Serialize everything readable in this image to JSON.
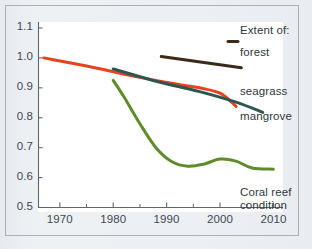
{
  "chart_data": {
    "type": "line",
    "title": "",
    "subtitle": "",
    "xlabel": "",
    "ylabel": "",
    "xlim": [
      1966,
      2012
    ],
    "ylim": [
      0.5,
      1.12
    ],
    "grid": false,
    "legend_position": "right",
    "x_ticks": [
      1970,
      1980,
      1990,
      2000,
      2010
    ],
    "x_tick_labels": [
      "1970",
      "1980",
      "1990",
      "2000",
      "2010"
    ],
    "x_minor_ticks": [
      1965,
      1975,
      1985,
      1995,
      2005
    ],
    "y_ticks": [
      0.5,
      0.6,
      0.7,
      0.8,
      0.9,
      1.0,
      1.1
    ],
    "y_tick_labels": [
      "0.5",
      "0.6",
      "0.7",
      "0.8",
      "0.9",
      "1.0",
      "1.1"
    ],
    "series": [
      {
        "name": "forest",
        "color": "#3b2a18",
        "label": "forest",
        "points": [
          [
            1989,
            1.005
          ],
          [
            1995,
            0.99
          ],
          [
            2004,
            0.967
          ]
        ]
      },
      {
        "name": "seagrass",
        "color": "#e8431f",
        "label": "seagrass",
        "points": [
          [
            1967,
            1.0
          ],
          [
            1975,
            0.973
          ],
          [
            1985,
            0.935
          ],
          [
            1992,
            0.912
          ],
          [
            1997,
            0.897
          ],
          [
            2000,
            0.882
          ],
          [
            2002,
            0.855
          ],
          [
            2003,
            0.838
          ]
        ]
      },
      {
        "name": "mangrove",
        "color": "#2d5650",
        "label": "mangrove",
        "points": [
          [
            1980,
            0.963
          ],
          [
            1988,
            0.922
          ],
          [
            1996,
            0.888
          ],
          [
            2003,
            0.852
          ],
          [
            2008,
            0.818
          ]
        ]
      },
      {
        "name": "coral reef condition",
        "color": "#5f8c29",
        "label": "Coral reef condition",
        "points": [
          [
            1980,
            0.925
          ],
          [
            1982,
            0.87
          ],
          [
            1985,
            0.78
          ],
          [
            1988,
            0.7
          ],
          [
            1991,
            0.653
          ],
          [
            1994,
            0.638
          ],
          [
            1997,
            0.645
          ],
          [
            2000,
            0.662
          ],
          [
            2003,
            0.655
          ],
          [
            2006,
            0.632
          ],
          [
            2010,
            0.628
          ]
        ]
      }
    ]
  },
  "legend": {
    "heading": "Extent of:",
    "items": [
      {
        "label": "forest",
        "color": "#3b2a18"
      },
      {
        "label": "seagrass",
        "color": "#e8431f"
      },
      {
        "label": "mangrove",
        "color": "#2d5650"
      }
    ]
  },
  "annotations": {
    "coral_reef_line1": "Coral reef",
    "coral_reef_line2": "condition"
  },
  "colors": {
    "forest": "#3b2a18",
    "seagrass": "#e8431f",
    "mangrove": "#2d5650",
    "coral": "#5f8c29",
    "axis": "#5b6670",
    "text": "#3d4852",
    "frame": "#a8b0b8",
    "background": "#eaeef2",
    "plot_background": "#ffffff"
  }
}
